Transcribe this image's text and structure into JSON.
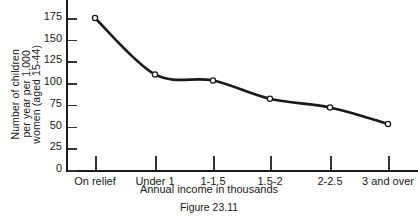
{
  "chart_data": {
    "type": "line",
    "title": "",
    "caption": "Figure 23.11",
    "xlabel": "Annual income in thousands",
    "ylabel_lines": [
      "Number of children",
      "per year per 1,000",
      "women (aged 15-44)"
    ],
    "ylabel": "Number of children per year per 1,000 women (aged 15-44)",
    "categories": [
      "On relief",
      "Under 1",
      "1-1.5",
      "1.5-2",
      "2-2.5",
      "3 and over"
    ],
    "values": [
      175,
      110,
      103,
      82,
      72,
      53
    ],
    "yticks": [
      0,
      25,
      50,
      75,
      100,
      125,
      150,
      175
    ],
    "ylim": [
      0,
      175
    ],
    "grid": false,
    "legend": "none",
    "marker": "open-circle",
    "line_color": "#1a1a1a",
    "marker_fill": "#ffffff"
  }
}
